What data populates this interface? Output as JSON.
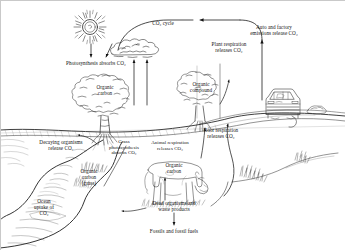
{
  "diagram": {
    "background": "#ffffff",
    "ink": "#1a1a1a"
  },
  "labels": {
    "co2_cycle": "CO₂ cycle",
    "photosynthesis_absorbs": "Photosynthesis absorbs CO₂",
    "tree_organic_carbon": "Organic\ncarbon",
    "plant_respiration": "Plant respiration\nreleases CO₂",
    "organic_compound": "Organic\ncompound",
    "auto_factory_emissions": "Auto and factory\nemissions release CO₂",
    "root_respiration": "Root respiration\nreleases CO₂",
    "decaying_organisms": "Decaying organisms\nrelease CO₂",
    "grass_organic_carbon": "Organic\ncarbon\n(grass)",
    "grass_photosynthesis": "Grass\nphotosynthesis\nabsorbs CO₂",
    "animal_respiration": "Animal respiration\nreleases CO₂",
    "cow_organic_carbon": "Organic\ncarbon",
    "dead_organisms": "Dead organisms and\nwaste products",
    "fossils_fuels": "Fossils and fossil fuels",
    "ocean_uptake": "Ocean\nuptake of\nCO₂"
  },
  "elements": {
    "sun": "sun-icon",
    "cloud": "cloud-icon",
    "tree": "tree-icon",
    "shrub": "shrub-icon",
    "car": "car-icon",
    "cow": "cow-icon",
    "water": "ocean-icon",
    "grass": "grass-icon"
  }
}
